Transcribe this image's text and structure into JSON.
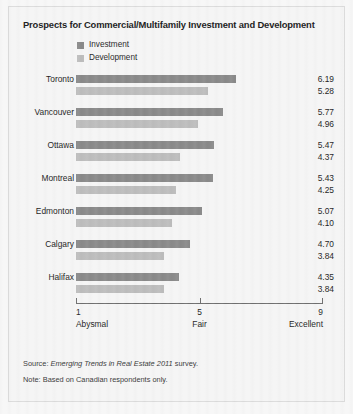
{
  "chart_data": {
    "type": "bar",
    "title": "Prospects for Commercial/Multifamily Investment and Development",
    "orientation": "horizontal",
    "categories": [
      "Toronto",
      "Vancouver",
      "Ottawa",
      "Montreal",
      "Edmonton",
      "Calgary",
      "Halifax"
    ],
    "series": [
      {
        "name": "Investment",
        "color": "#8a8a8a",
        "values": [
          6.19,
          5.77,
          5.47,
          5.43,
          5.07,
          4.7,
          4.35
        ]
      },
      {
        "name": "Development",
        "color": "#bdbdbd",
        "values": [
          5.28,
          4.96,
          4.37,
          4.25,
          4.1,
          3.84,
          3.84
        ]
      }
    ],
    "xlabel": "",
    "ylabel": "",
    "xlim": [
      1,
      9
    ],
    "grid": false,
    "legend_position": "top-left",
    "axis": {
      "ticks": [
        {
          "value": 1,
          "label": "1",
          "caption": "Abysmal"
        },
        {
          "value": 5,
          "label": "5",
          "caption": "Fair"
        },
        {
          "value": 9,
          "label": "9",
          "caption": "Excellent"
        }
      ]
    },
    "value_labels_displayed": true
  },
  "footer": {
    "source_prefix": "Source: ",
    "source_italic": "Emerging Trends in Real Estate 2011",
    "source_suffix": " survey.",
    "note": "Note: Based on Canadian respondents only."
  }
}
